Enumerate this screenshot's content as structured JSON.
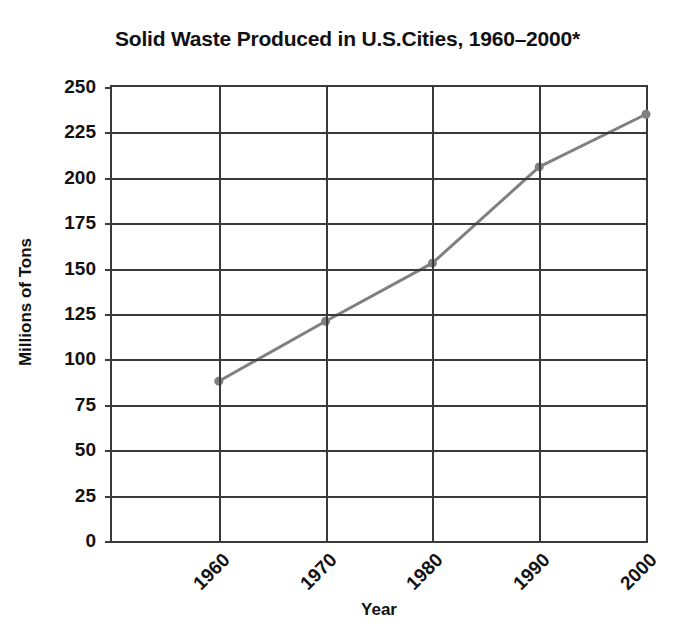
{
  "chart_data": {
    "type": "line",
    "title": "Solid Waste Produced in U.S.Cities, 1960–2000*",
    "xlabel": "Year",
    "ylabel": "Millions of Tons",
    "categories": [
      "1960",
      "1970",
      "1980",
      "1990",
      "2000"
    ],
    "x": [
      1960,
      1970,
      1980,
      1990,
      2000
    ],
    "series": [
      {
        "name": "Solid Waste Produced",
        "values": [
          88,
          121,
          153,
          206,
          235
        ],
        "color": "#808080",
        "marker": "circle",
        "line_width": 3
      }
    ],
    "ylim": [
      0,
      250
    ],
    "yticks": [
      0,
      25,
      50,
      75,
      100,
      125,
      150,
      175,
      200,
      225,
      250
    ],
    "ytick_labels": [
      "0",
      "25",
      "50",
      "75",
      "100",
      "125",
      "150",
      "175",
      "200",
      "225",
      "250"
    ],
    "xtick_labels": [
      "1960",
      "1970",
      "1980",
      "1990",
      "2000"
    ],
    "xtick_rotation": -45,
    "grid": {
      "horizontal": true,
      "vertical": true,
      "color": "#3a3a3a"
    },
    "legend": null,
    "legend_position": "none",
    "axis_color": "#3a3a3a",
    "background": "#ffffff",
    "footnote_marker": "*"
  }
}
